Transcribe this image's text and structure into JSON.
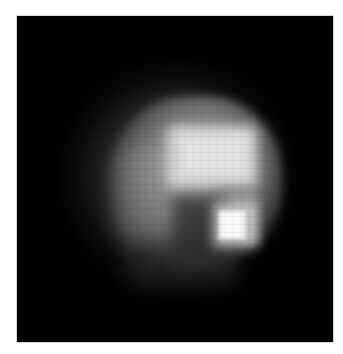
{
  "image": {
    "description": "Low-resolution grayscale image of a diffuse bright object on black background",
    "background_color": "#000000",
    "border_color": "#ffffff",
    "features": [
      {
        "name": "diffuse-glow",
        "color": "#787878"
      },
      {
        "name": "bright-patch",
        "color": "#d8d8d8"
      },
      {
        "name": "hot-spot",
        "color": "#f8f8f8"
      },
      {
        "name": "dark-notch",
        "color": "#282828"
      }
    ]
  }
}
